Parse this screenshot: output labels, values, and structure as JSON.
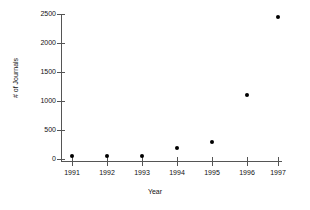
{
  "chart_data": {
    "type": "scatter",
    "title": "",
    "xlabel": "Year",
    "ylabel": "# of Journals",
    "categories": [
      "1991",
      "1992",
      "1993",
      "1994",
      "1995",
      "1996",
      "1997"
    ],
    "x": [
      1991,
      1992,
      1993,
      1994,
      1995,
      1996,
      1997
    ],
    "values": [
      50,
      60,
      60,
      190,
      300,
      1100,
      2450
    ],
    "series": [
      {
        "name": "# of Journals",
        "values": [
          50,
          60,
          60,
          190,
          300,
          1100,
          2450
        ]
      }
    ],
    "xlim": [
      1990.6,
      1997.6
    ],
    "ylim": [
      -100,
      2560
    ],
    "yticks": [
      0,
      500,
      1000,
      1500,
      2000,
      2500
    ],
    "ytick_labels": [
      "0",
      "500",
      "1000",
      "1500",
      "2000",
      "2500"
    ],
    "xticks": [
      1991,
      1992,
      1993,
      1994,
      1995,
      1996,
      1997
    ],
    "xtick_labels": [
      "1991",
      "1992",
      "1993",
      "1994",
      "1995",
      "1996",
      "1997"
    ],
    "grid": false,
    "legend": false,
    "legend_position": "none",
    "marker": "filled-circle",
    "marker_color": "#000000",
    "axis_color": "#555555"
  }
}
